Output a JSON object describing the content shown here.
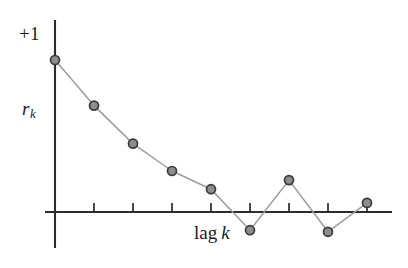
{
  "figure": {
    "name": "correlogram",
    "background_color": "#ffffff",
    "axis_color": "#2b2b2b",
    "line_color": "#9a9a9a",
    "marker_fill": "#8d8d8d",
    "marker_stroke": "#3a3a3a"
  },
  "labels": {
    "y_axis_top": "+1",
    "y_axis_name_var": "r",
    "y_axis_name_sub": "k",
    "x_axis_name_text": "lag",
    "x_axis_name_var": "k"
  },
  "chart_data": {
    "type": "line",
    "title": "",
    "subtitle": "",
    "xlabel": "lag k",
    "ylabel": "r_k",
    "grid": false,
    "legend": false,
    "x": [
      0,
      1,
      2,
      3,
      4,
      5,
      6,
      7,
      8
    ],
    "values": [
      1.0,
      0.7,
      0.45,
      0.27,
      0.15,
      -0.12,
      0.21,
      -0.13,
      0.06
    ],
    "categories": [
      "0",
      "1",
      "2",
      "3",
      "4",
      "5",
      "6",
      "7",
      "8"
    ],
    "xlim": [
      0,
      8.6
    ],
    "ylim": [
      -0.3,
      1.15
    ],
    "y_ticks_labeled": [
      "+1"
    ],
    "x_tick_count": 9,
    "x_tick_labels": [
      "",
      "",
      "",
      "",
      "",
      "",
      "",
      "",
      ""
    ],
    "annotations": [],
    "marker": "circle",
    "marker_size": 9
  },
  "geometry": {
    "origin_x": 55,
    "baseline_y": 212,
    "x_step": 39,
    "unit_y_px": 152,
    "y_axis_top_px": 20,
    "y_axis_bottom_px": 248,
    "x_axis_right_px": 392,
    "tick_height": 9,
    "point_px": [
      {
        "x": 55,
        "y": 60
      },
      {
        "x": 93,
        "y": 106
      },
      {
        "x": 132,
        "y": 145
      },
      {
        "x": 171,
        "y": 171
      },
      {
        "x": 210,
        "y": 190
      },
      {
        "x": 249,
        "y": 231
      },
      {
        "x": 288,
        "y": 180
      },
      {
        "x": 327,
        "y": 232
      },
      {
        "x": 366,
        "y": 202
      }
    ],
    "tick_px": [
      93,
      132,
      171,
      210,
      249,
      288,
      327,
      366
    ]
  }
}
